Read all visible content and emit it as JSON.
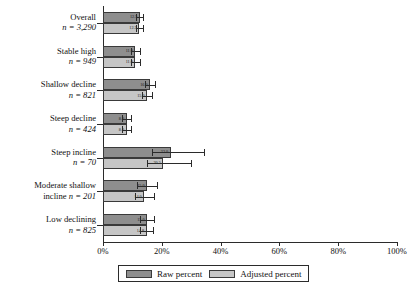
{
  "chart_data": {
    "type": "bar",
    "orientation": "horizontal",
    "title": "",
    "xlabel": "",
    "ylabel": "",
    "xlim": [
      0,
      100
    ],
    "xticks": [
      0,
      20,
      40,
      60,
      80,
      100
    ],
    "xtick_labels": [
      "0%",
      "20%",
      "40%",
      "60%",
      "80%",
      "100%"
    ],
    "grid": false,
    "legend_position": "bottom",
    "categories": [
      "Overall",
      "Stable high",
      "Shallow decline",
      "Steep decline",
      "Steep incline",
      "Moderate shallow incline",
      "Low declining"
    ],
    "category_n_labels": [
      "n = 3,290",
      "n = 949",
      "n = 821",
      "n = 424",
      "n = 70",
      "n = 201",
      "n = 825"
    ],
    "category_n_values": [
      3290,
      949,
      821,
      424,
      70,
      201,
      825
    ],
    "series": [
      {
        "name": "Raw percent",
        "color": "#8e8e8e",
        "values": [
          12.5,
          11.0,
          16.0,
          8.0,
          23.0,
          15.0,
          15.0
        ],
        "err_low": [
          1.2,
          1.6,
          1.8,
          1.5,
          6.5,
          3.5,
          2.3
        ],
        "err_high": [
          1.2,
          1.6,
          1.8,
          1.5,
          11.5,
          3.5,
          2.3
        ]
      },
      {
        "name": "Adjusted percent",
        "color": "#c6c6c6",
        "values": [
          12.3,
          11.0,
          15.0,
          8.0,
          20.5,
          14.0,
          14.8
        ],
        "err_low": [
          1.2,
          1.6,
          1.8,
          1.5,
          5.5,
          3.2,
          2.2
        ],
        "err_high": [
          1.2,
          1.6,
          1.8,
          1.5,
          9.5,
          3.2,
          2.2
        ]
      }
    ],
    "bar_value_labels": [
      [
        "12.5",
        "12.3"
      ],
      [
        "11.0",
        "11.0"
      ],
      [
        "16.0",
        "15.0"
      ],
      [
        "8.0",
        "8.0"
      ],
      [
        "23.0",
        "20.5"
      ],
      [
        "15.0",
        "14.0"
      ],
      [
        "15.0",
        "14.8"
      ]
    ]
  },
  "legend": {
    "items": [
      {
        "label": "Raw percent",
        "swatch": "raw"
      },
      {
        "label": "Adjusted percent",
        "swatch": "adjusted"
      }
    ]
  },
  "colors": {
    "raw": "#8e8e8e",
    "adjusted": "#c6c6c6",
    "axis": "#2b2b2b",
    "bar_outline": "#3a3a3a",
    "background": "#ffffff"
  }
}
